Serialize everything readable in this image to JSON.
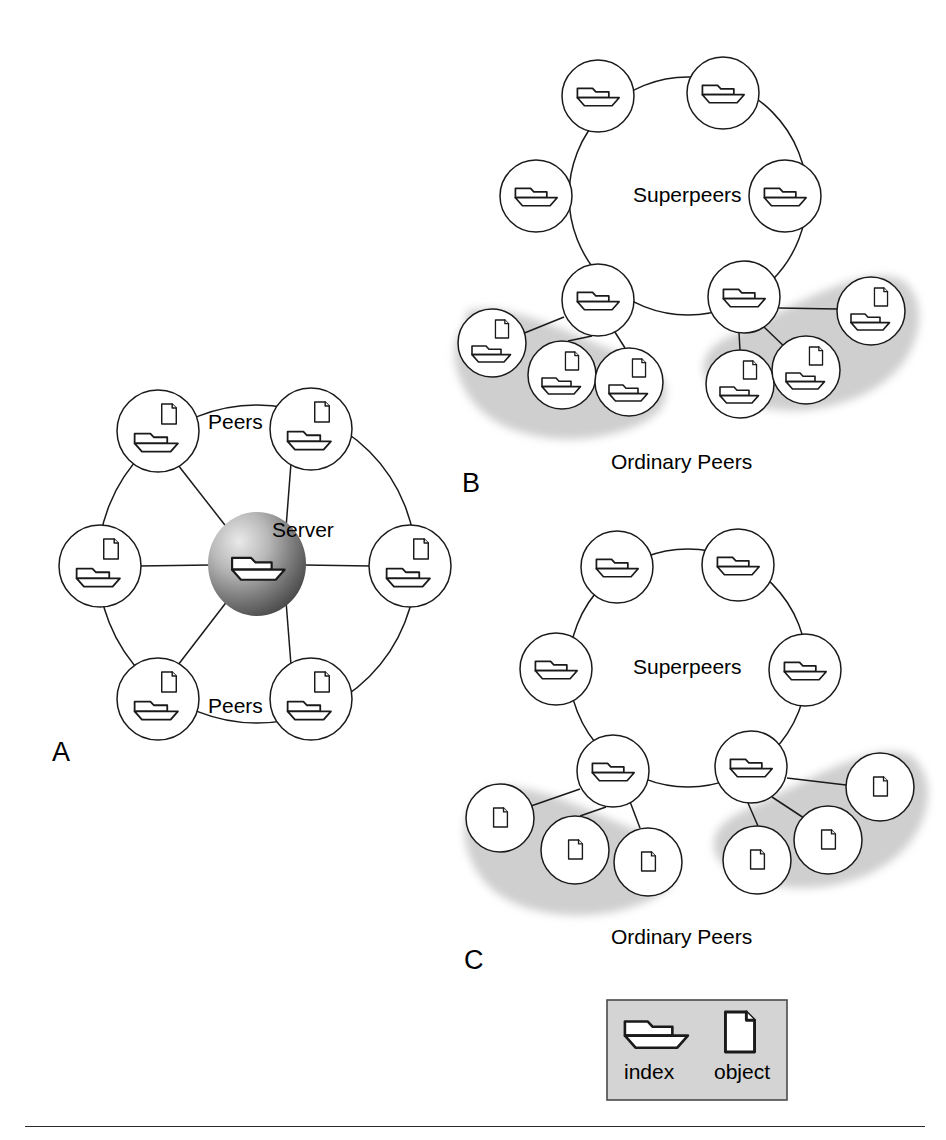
{
  "figure": {
    "type": "diagram",
    "background_color": "#ffffff",
    "stroke_color": "#1a1a1a",
    "blob_color": "#cfcfcf",
    "legend_fill": "#d4d4d4",
    "rule_color": "#2b2b2b"
  },
  "panels": [
    {
      "id": "A",
      "letter": "A",
      "letter_pos": {
        "x": 58,
        "y": 756
      },
      "description": "Centralized server with peers in a ring",
      "labels": [
        {
          "key": "peers_top",
          "text": "Peers",
          "x": 243,
          "y": 425
        },
        {
          "key": "server",
          "text": "Server",
          "x": 310,
          "y": 532
        },
        {
          "key": "peers_bottom",
          "text": "Peers",
          "x": 243,
          "y": 709
        }
      ],
      "center_node": {
        "name": "server-sphere",
        "cx": 257,
        "cy": 564,
        "r": 47,
        "icons": [
          "index"
        ]
      },
      "ring": {
        "cx": 257,
        "cy": 564,
        "r": 159
      },
      "peer_nodes": [
        {
          "id": "a-peer-1",
          "cx": 158,
          "cy": 431,
          "r": 41,
          "icons": [
            "index",
            "object"
          ]
        },
        {
          "id": "a-peer-2",
          "cx": 311,
          "cy": 429,
          "r": 41,
          "icons": [
            "index",
            "object"
          ]
        },
        {
          "id": "a-peer-3",
          "cx": 410,
          "cy": 566,
          "r": 41,
          "icons": [
            "index",
            "object"
          ]
        },
        {
          "id": "a-peer-4",
          "cx": 311,
          "cy": 699,
          "r": 41,
          "icons": [
            "index",
            "object"
          ]
        },
        {
          "id": "a-peer-5",
          "cx": 158,
          "cy": 699,
          "r": 41,
          "icons": [
            "index",
            "object"
          ]
        },
        {
          "id": "a-peer-6",
          "cx": 100,
          "cy": 566,
          "r": 41,
          "icons": [
            "index",
            "object"
          ]
        }
      ]
    },
    {
      "id": "B",
      "letter": "B",
      "letter_pos": {
        "x": 468,
        "y": 487
      },
      "description": "Superpeer network; ordinary peers hold index and objects",
      "labels": [
        {
          "key": "superpeers",
          "text": "Superpeers",
          "x": 690,
          "y": 198
        },
        {
          "key": "ordinary_peers",
          "text": "Ordinary Peers",
          "x": 689,
          "y": 463
        }
      ],
      "ring": {
        "cx": 688,
        "cy": 196,
        "r": 119
      },
      "superpeer_nodes": [
        {
          "id": "b-sp-1",
          "cx": 598,
          "cy": 96,
          "r": 36,
          "icons": [
            "index"
          ]
        },
        {
          "id": "b-sp-2",
          "cx": 723,
          "cy": 93,
          "r": 36,
          "icons": [
            "index"
          ]
        },
        {
          "id": "b-sp-3",
          "cx": 785,
          "cy": 196,
          "r": 36,
          "icons": [
            "index"
          ]
        },
        {
          "id": "b-sp-4",
          "cx": 744,
          "cy": 297,
          "r": 36,
          "icons": [
            "index"
          ]
        },
        {
          "id": "b-sp-5",
          "cx": 598,
          "cy": 300,
          "r": 36,
          "icons": [
            "index"
          ]
        },
        {
          "id": "b-sp-6",
          "cx": 536,
          "cy": 196,
          "r": 36,
          "icons": [
            "index"
          ]
        }
      ],
      "ordinary_nodes": [
        {
          "id": "b-op-1",
          "cx": 492,
          "cy": 343,
          "r": 34,
          "icons": [
            "index",
            "object"
          ],
          "parent": "b-sp-5"
        },
        {
          "id": "b-op-2",
          "cx": 562,
          "cy": 375,
          "r": 34,
          "icons": [
            "index",
            "object"
          ],
          "parent": "b-sp-5"
        },
        {
          "id": "b-op-3",
          "cx": 629,
          "cy": 382,
          "r": 34,
          "icons": [
            "index",
            "object"
          ],
          "parent": "b-sp-5"
        },
        {
          "id": "b-op-4",
          "cx": 740,
          "cy": 384,
          "r": 34,
          "icons": [
            "index",
            "object"
          ],
          "parent": "b-sp-4"
        },
        {
          "id": "b-op-5",
          "cx": 806,
          "cy": 370,
          "r": 34,
          "icons": [
            "index",
            "object"
          ],
          "parent": "b-sp-4"
        },
        {
          "id": "b-op-6",
          "cx": 871,
          "cy": 311,
          "r": 34,
          "icons": [
            "index",
            "object"
          ],
          "parent": "b-sp-4"
        }
      ],
      "blobs": [
        "left-ordinary-peer-blob",
        "right-ordinary-peer-blob"
      ]
    },
    {
      "id": "C",
      "letter": "C",
      "letter_pos": {
        "x": 470,
        "y": 964
      },
      "description": "Superpeer network; ordinary peers hold only objects",
      "labels": [
        {
          "key": "superpeers",
          "text": "Superpeers",
          "x": 690,
          "y": 670
        },
        {
          "key": "ordinary_peers",
          "text": "Ordinary Peers",
          "x": 689,
          "y": 938
        }
      ],
      "ring": {
        "cx": 688,
        "cy": 668,
        "r": 119
      },
      "superpeer_nodes": [
        {
          "id": "c-sp-1",
          "cx": 617,
          "cy": 567,
          "r": 36,
          "icons": [
            "index"
          ]
        },
        {
          "id": "c-sp-2",
          "cx": 738,
          "cy": 565,
          "r": 36,
          "icons": [
            "index"
          ]
        },
        {
          "id": "c-sp-3",
          "cx": 805,
          "cy": 670,
          "r": 36,
          "icons": [
            "index"
          ]
        },
        {
          "id": "c-sp-4",
          "cx": 751,
          "cy": 767,
          "r": 36,
          "icons": [
            "index"
          ]
        },
        {
          "id": "c-sp-5",
          "cx": 613,
          "cy": 771,
          "r": 36,
          "icons": [
            "index"
          ]
        },
        {
          "id": "c-sp-6",
          "cx": 556,
          "cy": 669,
          "r": 36,
          "icons": [
            "index"
          ]
        }
      ],
      "ordinary_nodes": [
        {
          "id": "c-op-1",
          "cx": 500,
          "cy": 818,
          "r": 34,
          "icons": [
            "object"
          ],
          "parent": "c-sp-5"
        },
        {
          "id": "c-op-2",
          "cx": 575,
          "cy": 850,
          "r": 34,
          "icons": [
            "object"
          ],
          "parent": "c-sp-5"
        },
        {
          "id": "c-op-3",
          "cx": 648,
          "cy": 862,
          "r": 34,
          "icons": [
            "object"
          ],
          "parent": "c-sp-5"
        },
        {
          "id": "c-op-4",
          "cx": 757,
          "cy": 860,
          "r": 34,
          "icons": [
            "object"
          ],
          "parent": "c-sp-4"
        },
        {
          "id": "c-op-5",
          "cx": 828,
          "cy": 840,
          "r": 34,
          "icons": [
            "object"
          ],
          "parent": "c-sp-4"
        },
        {
          "id": "c-op-6",
          "cx": 880,
          "cy": 787,
          "r": 34,
          "icons": [
            "object"
          ],
          "parent": "c-sp-4"
        }
      ],
      "blobs": [
        "left-ordinary-peer-blob",
        "right-ordinary-peer-blob"
      ]
    }
  ],
  "legend": {
    "box": {
      "x": 607,
      "y": 1000,
      "width": 180,
      "height": 100
    },
    "items": [
      {
        "key": "index",
        "label": "index",
        "icon": "folder-index-icon",
        "label_x": 656,
        "label_y": 1081
      },
      {
        "key": "object",
        "label": "object",
        "icon": "document-object-icon",
        "label_x": 744,
        "label_y": 1081
      }
    ]
  },
  "icons": {
    "index": "folder-index-icon",
    "object": "document-object-icon",
    "server": "server-sphere-icon"
  }
}
